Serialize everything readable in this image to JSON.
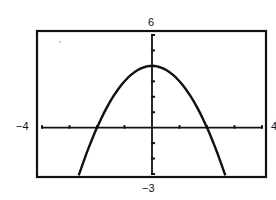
{
  "chart_data": {
    "type": "line",
    "title": "",
    "function": "y = 4 - x^2",
    "xlabel": "",
    "ylabel": "",
    "xlim": [
      -4,
      4
    ],
    "ylim": [
      -3,
      6
    ],
    "xscale": 1,
    "yscale": 1,
    "grid": false,
    "window_labels": {
      "xmin": "−4",
      "xmax": "4",
      "ymin": "−3",
      "ymax": "6"
    },
    "series": [
      {
        "name": "parabola",
        "x": [
          -2.65,
          -2.5,
          -2,
          -1.5,
          -1,
          -0.5,
          0,
          0.5,
          1,
          1.5,
          2,
          2.5,
          2.65
        ],
        "y": [
          -3.0,
          -2.25,
          0,
          1.75,
          3,
          3.75,
          4,
          3.75,
          3,
          1.75,
          0,
          -2.25,
          -3.0
        ]
      }
    ],
    "key_points": {
      "vertex": [
        0,
        4
      ],
      "x_intercepts": [
        -2,
        2
      ],
      "y_intercept": 4
    }
  },
  "labels": {
    "ymax": "6",
    "ymin": "−3",
    "xmin": "−4",
    "xmax": "4"
  },
  "colors": {
    "ink": "#111111",
    "background": "#ffffff"
  }
}
